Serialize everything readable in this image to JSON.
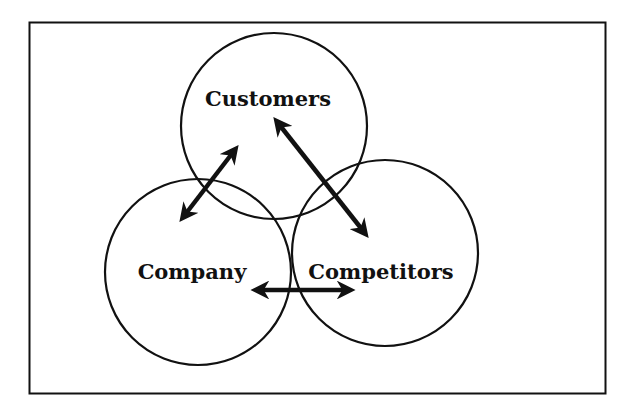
{
  "diagram": {
    "type": "venn-three-circle",
    "stroke_color": "#111111",
    "background": "#ffffff",
    "circles": [
      {
        "id": "customers",
        "label": "Customers"
      },
      {
        "id": "company",
        "label": "Company"
      },
      {
        "id": "competitors",
        "label": "Competitors"
      }
    ],
    "relationships": [
      {
        "from": "company",
        "to": "customers",
        "bidirectional": true
      },
      {
        "from": "customers",
        "to": "competitors",
        "bidirectional": true
      },
      {
        "from": "company",
        "to": "competitors",
        "bidirectional": true
      }
    ]
  }
}
